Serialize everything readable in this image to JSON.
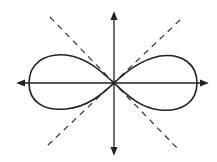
{
  "diagram": {
    "type": "lemniscate",
    "colors": {
      "background": "#ffffff",
      "stroke": "#222222"
    },
    "origin": [
      114,
      83
    ],
    "axes": {
      "horizontal": {
        "from": [
          16,
          83
        ],
        "to": [
          208,
          83
        ],
        "arrows": "both"
      },
      "vertical": {
        "from": [
          114,
          12
        ],
        "to": [
          114,
          155
        ],
        "arrows": "both"
      }
    },
    "dashed_lines": [
      {
        "from": [
          50,
          17
        ],
        "to": [
          177,
          148
        ]
      },
      {
        "from": [
          180,
          20
        ],
        "to": [
          47,
          146
        ]
      }
    ],
    "curve": {
      "left_extent": 28,
      "right_extent": 197,
      "top": 55,
      "bottom": 110
    }
  }
}
